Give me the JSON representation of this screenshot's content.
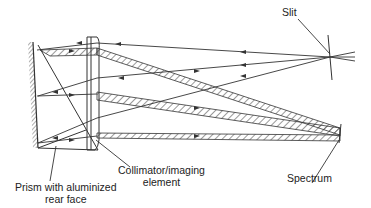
{
  "diagram": {
    "labels": {
      "slit": "Slit",
      "spectrum": "Spectrum",
      "collimator_line1": "Collimator/imaging",
      "collimator_line2": "element",
      "prism_line1": "Prism with aluminized",
      "prism_line2": "rear face"
    },
    "colors": {
      "line": "#333333",
      "background": "#ffffff"
    }
  }
}
